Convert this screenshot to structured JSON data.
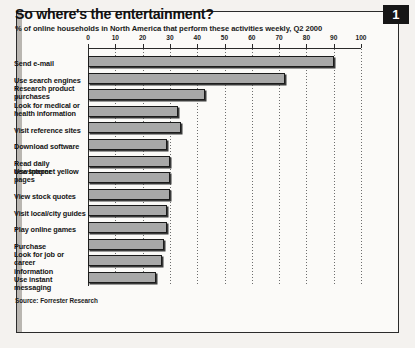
{
  "figure": {
    "badge_number": "1",
    "title": "So where's the entertainment?",
    "subtitle": "% of online households in North America that perform these activities weekly, Q2 2000",
    "source": "Source: Forrester Research"
  },
  "chart_data": {
    "type": "bar",
    "orientation": "horizontal",
    "title": "So where's the entertainment?",
    "subtitle": "% of online households in North America that perform these activities weekly, Q2 2000",
    "xlabel": "",
    "ylabel": "",
    "xlim": [
      0,
      100
    ],
    "xticks": [
      0,
      10,
      20,
      30,
      40,
      50,
      60,
      70,
      80,
      90,
      100
    ],
    "xtick_labels": [
      "0",
      "10",
      "20",
      "30",
      "40",
      "50",
      "60",
      "70",
      "80",
      "90",
      "100"
    ],
    "grid": true,
    "grid_style": "dotted-vertical",
    "legend": false,
    "bar_color": "#a8a8a8",
    "bar_edge_color": "#1b1b1b",
    "categories": [
      "Send e-mail",
      "Use search engines",
      "Research product purchases",
      "Look for medical or health information",
      "Visit reference sites",
      "Download software",
      "Read daily newspaper",
      "Use Internet yellow pages",
      "View stock quotes",
      "Visit local/city guides",
      "Play online games",
      "Purchase",
      "Look for job or career information",
      "Use instant messaging"
    ],
    "category_lines": [
      [
        "Send e-mail"
      ],
      [
        "Use search engines"
      ],
      [
        "Research product",
        "purchases"
      ],
      [
        "Look for medical or",
        "health information"
      ],
      [
        "Visit reference sites"
      ],
      [
        "Download software"
      ],
      [
        "Read daily newspaper"
      ],
      [
        "Use Internet yellow",
        "pages"
      ],
      [
        "View stock quotes"
      ],
      [
        "Visit local/city guides"
      ],
      [
        "Play online games"
      ],
      [
        "Purchase"
      ],
      [
        "Look for job or career",
        "information"
      ],
      [
        "Use instant messaging"
      ]
    ],
    "values": [
      90,
      72,
      43,
      33,
      34,
      29,
      30,
      30,
      30,
      29,
      29,
      28,
      27,
      25
    ]
  }
}
